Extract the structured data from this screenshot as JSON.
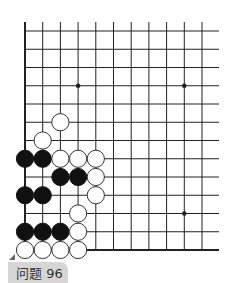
{
  "puzzle": {
    "label": "问题 96"
  },
  "board": {
    "origin_x": 25,
    "origin_y": 31,
    "spacing_x": 17.7,
    "spacing_y": 18.25,
    "cols": 11,
    "rows": 13,
    "line_right_extent": 219,
    "line_top_extent": 22,
    "star_points": [
      {
        "col": 3,
        "row": 3
      },
      {
        "col": 9,
        "row": 3
      },
      {
        "col": 9,
        "row": 10
      }
    ],
    "stones": [
      {
        "color": "white",
        "col": 2,
        "row": 5
      },
      {
        "color": "white",
        "col": 1,
        "row": 6
      },
      {
        "color": "black",
        "col": 0,
        "row": 7
      },
      {
        "color": "black",
        "col": 1,
        "row": 7
      },
      {
        "color": "white",
        "col": 2,
        "row": 7
      },
      {
        "color": "white",
        "col": 3,
        "row": 7
      },
      {
        "color": "white",
        "col": 4,
        "row": 7
      },
      {
        "color": "black",
        "col": 2,
        "row": 8
      },
      {
        "color": "black",
        "col": 3,
        "row": 8
      },
      {
        "color": "white",
        "col": 4,
        "row": 8
      },
      {
        "color": "black",
        "col": 0,
        "row": 9
      },
      {
        "color": "black",
        "col": 1,
        "row": 9
      },
      {
        "color": "white",
        "col": 4,
        "row": 9
      },
      {
        "color": "white",
        "col": 3,
        "row": 10
      },
      {
        "color": "black",
        "col": 0,
        "row": 11
      },
      {
        "color": "black",
        "col": 1,
        "row": 11
      },
      {
        "color": "black",
        "col": 2,
        "row": 11
      },
      {
        "color": "white",
        "col": 3,
        "row": 11
      },
      {
        "color": "white",
        "col": 0,
        "row": 12
      },
      {
        "color": "white",
        "col": 1,
        "row": 12
      },
      {
        "color": "white",
        "col": 2,
        "row": 12
      },
      {
        "color": "white",
        "col": 3,
        "row": 12
      }
    ]
  },
  "colors": {
    "line": "#222222",
    "black_stone": "#111111",
    "white_stone": "#ffffff",
    "label_bg": "#d6d6d6"
  }
}
